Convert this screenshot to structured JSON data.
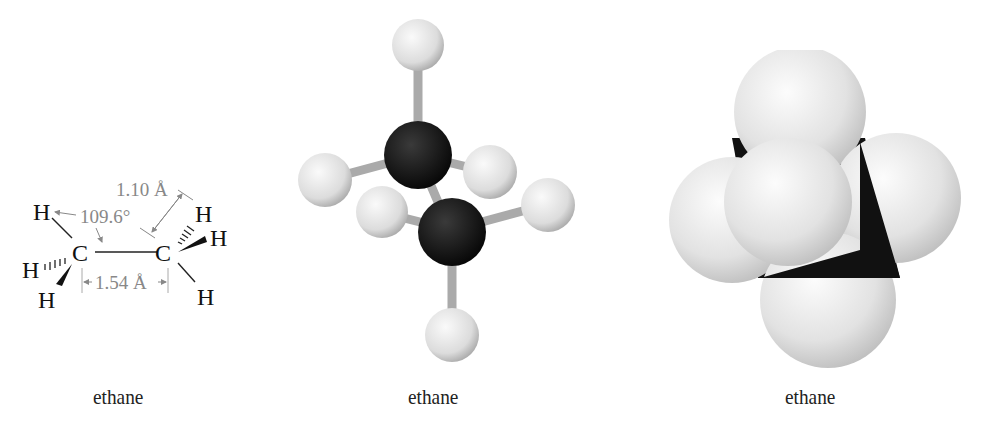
{
  "panels": [
    {
      "id": "structural-formula",
      "caption": "ethane",
      "atoms": {
        "c1": "C",
        "c2": "C",
        "h": "H"
      },
      "measurements": {
        "bond_angle": "109.6°",
        "ch_bond_length": "1.10 Å",
        "cc_bond_length": "1.54 Å"
      }
    },
    {
      "id": "ball-and-stick-model",
      "caption": "ethane"
    },
    {
      "id": "space-filling-model",
      "caption": "ethane"
    }
  ],
  "colors": {
    "carbon": "#111111",
    "hydrogen": "#e8e8e8",
    "annotation": "#888888"
  }
}
